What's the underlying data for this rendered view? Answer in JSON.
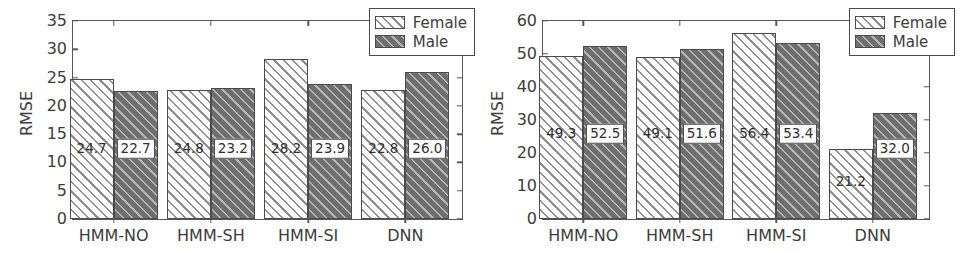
{
  "figure": {
    "panels": [
      {
        "id": "left",
        "chart_data": {
          "type": "bar",
          "title": "",
          "xlabel": "",
          "ylabel": "RMSE",
          "ylim": [
            0,
            35
          ],
          "yticks": [
            0,
            5,
            10,
            15,
            20,
            25,
            30,
            35
          ],
          "ytick_labels": [
            "0",
            "5",
            "10",
            "15",
            "20",
            "25",
            "30",
            "35"
          ],
          "grid": false,
          "legend_position": "upper right",
          "categories": [
            "HMM-NO",
            "HMM-SH",
            "HMM-SI",
            "DNN"
          ],
          "series": [
            {
              "name": "Female",
              "values": [
                24.7,
                22.8,
                28.2,
                22.8
              ],
              "value_labels": [
                "24.7",
                "24.8",
                "28.2",
                "22.8"
              ],
              "fill": "#ffffff",
              "hatch": "///"
            },
            {
              "name": "Male",
              "values": [
                22.7,
                23.2,
                23.9,
                26.0
              ],
              "value_labels": [
                "22.7",
                "23.2",
                "23.9",
                "26.0"
              ],
              "fill": "#6e6e6e",
              "hatch": "///"
            }
          ]
        }
      },
      {
        "id": "right",
        "chart_data": {
          "type": "bar",
          "title": "",
          "xlabel": "",
          "ylabel": "RMSE",
          "ylim": [
            0,
            60
          ],
          "yticks": [
            0,
            10,
            20,
            30,
            40,
            50,
            60
          ],
          "ytick_labels": [
            "0",
            "10",
            "20",
            "30",
            "40",
            "50",
            "60"
          ],
          "grid": false,
          "legend_position": "upper right",
          "categories": [
            "HMM-NO",
            "HMM-SH",
            "HMM-SI",
            "DNN"
          ],
          "series": [
            {
              "name": "Female",
              "values": [
                49.3,
                49.1,
                56.4,
                21.2
              ],
              "value_labels": [
                "49.3",
                "49.1",
                "56.4",
                "21.2"
              ],
              "fill": "#ffffff",
              "hatch": "///"
            },
            {
              "name": "Male",
              "values": [
                52.5,
                51.6,
                53.4,
                32.0
              ],
              "value_labels": [
                "52.5",
                "51.6",
                "53.4",
                "32.0"
              ],
              "fill": "#6e6e6e",
              "hatch": "///"
            }
          ]
        }
      }
    ]
  },
  "colors": {
    "female_fill": "#ffffff",
    "male_fill": "#6e6e6e",
    "hatch_line": "#8d8d8d",
    "axis": "#58585a",
    "text": "#3c3c3c",
    "background": "#ffffff"
  }
}
